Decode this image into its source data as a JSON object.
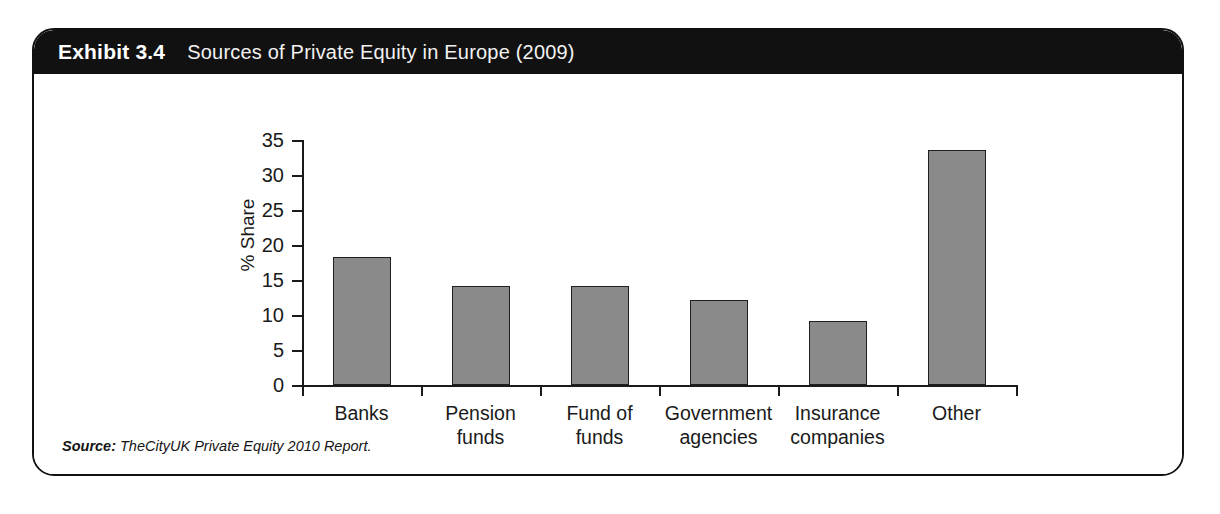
{
  "exhibit": {
    "number": "Exhibit 3.4",
    "title": "Sources of Private Equity in Europe (2009)",
    "header_bg": "#111111",
    "header_text_color": "#ffffff",
    "frame_border_color": "#111111"
  },
  "source": {
    "label": "Source:",
    "text": "TheCityUK Private Equity 2010 Report."
  },
  "chart_data": {
    "type": "bar",
    "title": "Sources of Private Equity in Europe (2009)",
    "categories": [
      "Banks",
      "Pension\nfunds",
      "Fund of\nfunds",
      "Government\nagencies",
      "Insurance\ncompanies",
      "Other"
    ],
    "values": [
      18.3,
      14.2,
      14.2,
      12.2,
      9.1,
      33.6
    ],
    "xlabel": "",
    "ylabel": "% Share",
    "ylim": [
      0,
      35
    ],
    "yticks": [
      0,
      5,
      10,
      15,
      20,
      25,
      30,
      35
    ],
    "ytick_labels": [
      "0",
      "5",
      "10",
      "15",
      "20",
      "25",
      "30",
      "35"
    ],
    "grid": false,
    "legend": false,
    "bar_fill": "#8a8a8a",
    "bar_edge": "#1f1f1f"
  }
}
